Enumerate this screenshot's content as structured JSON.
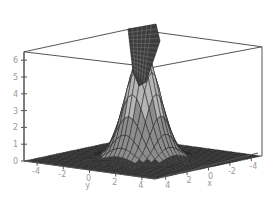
{
  "chart_data": {
    "type": "surface3d",
    "title": "",
    "xlabel": "x",
    "ylabel": "y",
    "zlabel": "",
    "x_ticks": [
      "4",
      "2",
      "0",
      "-2",
      "-4"
    ],
    "y_ticks": [
      "-4",
      "-2",
      "0",
      "2",
      "4"
    ],
    "z_ticks": [
      "0",
      "1",
      "2",
      "3",
      "4",
      "5",
      "6"
    ],
    "xlim": [
      -5,
      5
    ],
    "ylim": [
      -5,
      5
    ],
    "zlim": [
      0,
      6.5
    ],
    "grid": false,
    "surface": {
      "base_value": 0,
      "peak_center": [
        0,
        0
      ],
      "peak_height": 6.5,
      "peak_width": 1.0
    },
    "colors": {
      "surface_dark": "#3a3a3a",
      "surface_mid": "#8c8c8c",
      "surface_light": "#b5b5b5",
      "mesh": "#222222",
      "box": "#555555",
      "tick_text": "#9a9a9a"
    }
  }
}
